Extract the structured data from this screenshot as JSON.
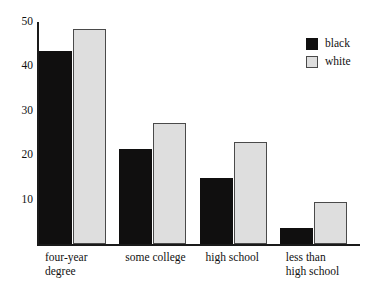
{
  "chart_data": {
    "type": "bar",
    "title": "",
    "subtitle": "",
    "xlabel": "",
    "ylabel": "",
    "ylim": [
      0,
      50
    ],
    "yticks": [
      10,
      20,
      30,
      40,
      50
    ],
    "grid": false,
    "legend_position": "top-right",
    "categories": [
      "four-year\ndegree",
      "some college",
      "high school",
      "less than\nhigh school"
    ],
    "series": [
      {
        "name": "black",
        "color": "#100f0f",
        "values": [
          43.5,
          21.3,
          14.8,
          3.6
        ]
      },
      {
        "name": "white",
        "color": "#dedede",
        "values": [
          48.5,
          27.3,
          23.0,
          9.4
        ]
      }
    ]
  },
  "legend": {
    "items": [
      {
        "label": "black",
        "swatch": "black-swatch"
      },
      {
        "label": "white",
        "swatch": "white-swatch"
      }
    ]
  },
  "axes": {
    "y_tick_labels": [
      "50",
      "40",
      "30",
      "20",
      "10"
    ]
  }
}
